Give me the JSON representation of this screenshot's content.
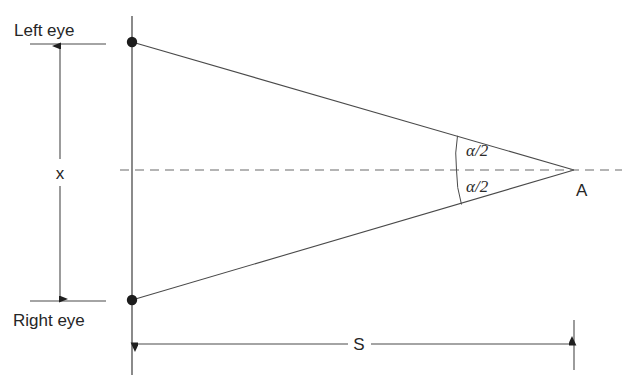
{
  "figure": {
    "background_color": "#ffffff",
    "line_color": "#3d3d3d",
    "labels": {
      "left_eye": "Left eye",
      "right_eye": "Right eye",
      "eye_separation": "x",
      "distance": "S",
      "apex_point": "A",
      "angle_upper": "α/2",
      "angle_lower": "α/2"
    },
    "geometry": {
      "left_eye_point": [
        132,
        42
      ],
      "right_eye_point": [
        132,
        300
      ],
      "apex_point": [
        574,
        170
      ],
      "eye_axis_top": [
        132,
        16
      ],
      "eye_axis_bottom": [
        132,
        375
      ],
      "centerline_start": [
        120,
        170
      ],
      "centerline_end": [
        622,
        170
      ],
      "x_dimension_line_x": 60,
      "x_dimension_top": 44,
      "x_dimension_bottom": 301,
      "s_dimension_line_y": 344,
      "s_dimension_left": 133,
      "s_dimension_right": 574,
      "s_label_x": 358,
      "s_tick_right_x": 574
    }
  }
}
